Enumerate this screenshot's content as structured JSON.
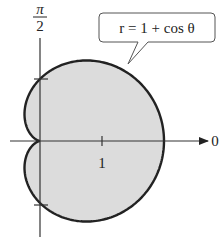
{
  "chart_data": {
    "type": "line",
    "subtype": "polar",
    "title": "",
    "equation": "r = 1 + cos θ",
    "curve": "cardioid",
    "theta_range": [
      0,
      6.283185
    ],
    "r_max": 2,
    "axis_labels": {
      "polar_axis": "0",
      "vertical_axis_top": "π",
      "vertical_axis_bottom": "2"
    },
    "tick_labels": [
      "1"
    ],
    "ticks": {
      "polar_axis": [
        1
      ],
      "vertical_axis": [
        1,
        -1
      ]
    },
    "fill_color": "#dcdcdc",
    "line_color": "#222222",
    "grid": false,
    "legend": "callout box top-right"
  },
  "labels": {
    "zero": "0",
    "pi": "π",
    "two": "2",
    "one": "1",
    "callout": "r = 1 + cos θ"
  }
}
